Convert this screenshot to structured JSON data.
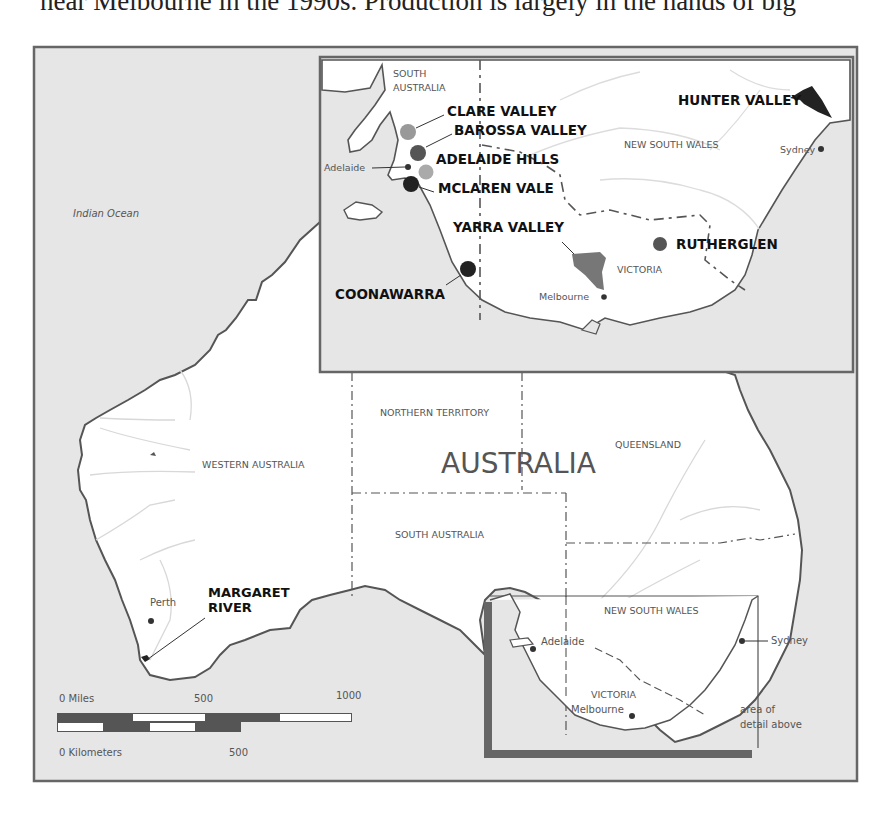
{
  "caption": "near Melbourne in the 1990s. Production is largely in the hands of big",
  "colors": {
    "sea": "#e6e6e6",
    "land": "#ffffff",
    "coast": "#555555",
    "frame": "#666666",
    "river": "#d8d8d8",
    "border": "#555555",
    "region_dark": "#333333",
    "region_mid": "#555555",
    "region_light": "#999999",
    "region_lighter": "#aaaaaa"
  },
  "main_map": {
    "ocean_label": "Indian Ocean",
    "country_label": "AUSTRALIA",
    "states": {
      "wa": "WESTERN AUSTRALIA",
      "nt": "NORTHERN TERRITORY",
      "qld": "QUEENSLAND",
      "sa": "SOUTH AUSTRALIA",
      "nsw": "NEW SOUTH WALES"
    },
    "cities": {
      "perth": "Perth",
      "adelaide": "Adelaide",
      "melbourne": "Melbourne",
      "sydney": "Sydney"
    },
    "regions": {
      "margaret_river_line1": "MARGARET",
      "margaret_river_line2": "RIVER"
    },
    "locator_states": {
      "nsw": "NEW SOUTH WALES",
      "vic": "VICTORIA"
    },
    "locator_note_line1": "area of",
    "locator_note_line2": "detail above"
  },
  "inset": {
    "states": {
      "sa_line1": "SOUTH",
      "sa_line2": "AUSTRALIA",
      "nsw": "NEW SOUTH WALES",
      "vic": "VICTORIA"
    },
    "cities": {
      "adelaide": "Adelaide",
      "melbourne": "Melbourne",
      "sydney": "Sydney"
    },
    "regions": {
      "clare": "CLARE VALLEY",
      "barossa": "BAROSSA VALLEY",
      "adelaide_hills": "ADELAIDE HILLS",
      "mclaren": "MCLAREN VALE",
      "yarra": "YARRA VALLEY",
      "coonawarra": "COONAWARRA",
      "rutherglen": "RUTHERGLEN",
      "hunter": "HUNTER VALLEY"
    }
  },
  "scale": {
    "miles_label": "0  Miles",
    "miles_500": "500",
    "miles_1000": "1000",
    "km_label": "0  Kilometers",
    "km_500": "500"
  }
}
